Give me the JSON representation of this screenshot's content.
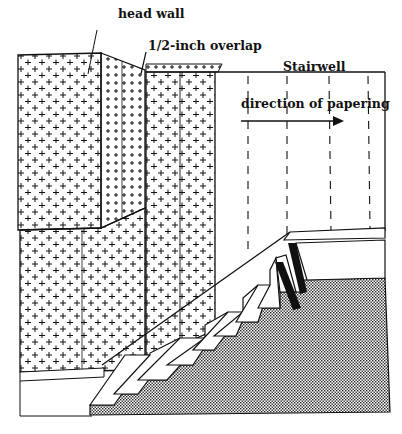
{
  "diagram": {
    "type": "illustration",
    "labels": {
      "head_wall": "head wall",
      "overlap": "1/2-inch overlap",
      "stairwell": "Stairwell",
      "direction": "direction of papering"
    },
    "legend": {
      "pattern_plus": "papered wall (cross pattern)",
      "dashed_lines": "plumb lines for next strips",
      "stippled": "stair stringer/floor area"
    },
    "colors": {
      "ink": "#111111",
      "paper": "#ffffff",
      "stipple": "#8a8a8a"
    },
    "steps_count": 11
  }
}
